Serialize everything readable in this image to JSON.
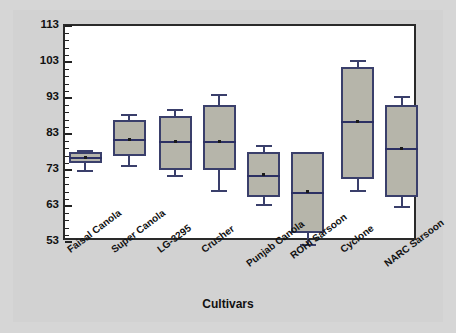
{
  "chart_data": {
    "type": "box",
    "title": "",
    "xlabel": "Cultivars",
    "ylabel": "Days to Anthesis (DTA)",
    "ylim": [
      53,
      113
    ],
    "ytick_labels": [
      "53",
      "63",
      "73",
      "83",
      "93",
      "103",
      "113"
    ],
    "ytick_values": [
      53,
      63,
      73,
      83,
      93,
      103,
      113
    ],
    "minor_tick_step": 2,
    "grid": false,
    "legend": null,
    "categories": [
      "Faisal Canola",
      "Super Canola",
      "LG-3295",
      "Crusher",
      "Punjab Canola",
      "ROHI Sarsoon",
      "Cyclone",
      "NARC Sarsoon"
    ],
    "boxes": [
      {
        "category": "Faisal Canola",
        "whisker_low": 73.0,
        "q1": 75.0,
        "median": 76.5,
        "q3": 78.0,
        "whisker_high": 78.5,
        "mean": 76.5
      },
      {
        "category": "Super Canola",
        "whisker_low": 74.5,
        "q1": 77.0,
        "median": 81.5,
        "q3": 87.0,
        "whisker_high": 88.5,
        "mean": 81.6
      },
      {
        "category": "LG-3295",
        "whisker_low": 71.5,
        "q1": 73.0,
        "median": 81.0,
        "q3": 88.0,
        "whisker_high": 90.0,
        "mean": 80.8
      },
      {
        "category": "Crusher",
        "whisker_low": 67.5,
        "q1": 73.0,
        "median": 81.0,
        "q3": 91.0,
        "whisker_high": 94.0,
        "mean": 80.8
      },
      {
        "category": "Punjab Canola",
        "whisker_low": 63.5,
        "q1": 65.5,
        "median": 71.5,
        "q3": 78.0,
        "whisker_high": 80.0,
        "mean": 71.7
      },
      {
        "category": "ROHI Sarsoon",
        "whisker_low": 52.5,
        "q1": 55.5,
        "median": 67.0,
        "q3": 78.0,
        "whisker_high": 77.5,
        "mean": 67.0
      },
      {
        "category": "Cyclone",
        "whisker_low": 67.5,
        "q1": 70.5,
        "median": 86.5,
        "q3": 101.5,
        "whisker_high": 103.5,
        "mean": 86.5
      },
      {
        "category": "NARC Sarsoon",
        "whisker_low": 63.0,
        "q1": 65.5,
        "median": 79.0,
        "q3": 91.0,
        "whisker_high": 93.5,
        "mean": 79.0
      }
    ],
    "colors": {
      "box_fill": "#b6b5aa",
      "box_edge": "#3a3f6b",
      "median": "#2c3063",
      "mean_marker": "#1a1a1a",
      "plot_background": "#ffffff",
      "figure_background": "#d6d6d6",
      "frame": "#2a2a2a",
      "text": "#111111"
    }
  }
}
